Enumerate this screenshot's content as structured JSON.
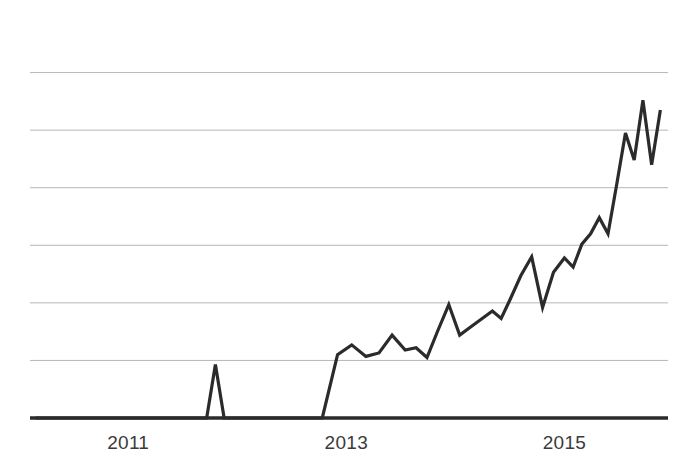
{
  "chart_data": {
    "type": "line",
    "title": "",
    "xlabel": "",
    "ylabel": "",
    "grid": true,
    "legend": false,
    "xlim": [
      2010.1,
      2015.95
    ],
    "ylim": [
      0,
      7
    ],
    "xticks": [
      2011,
      2013,
      2015
    ],
    "xtick_labels": [
      "2011",
      "2013",
      "2015"
    ],
    "yticks": [
      1,
      2,
      3,
      4,
      5,
      6
    ],
    "ytick_labels": [
      "",
      "",
      "",
      "",
      "",
      ""
    ],
    "gridline_count": 6,
    "series": [
      {
        "name": "value",
        "color": "#2b2b2b",
        "line_width": 3.2,
        "x": [
          2010.15,
          2010.35,
          2010.55,
          2010.75,
          2010.95,
          2011.15,
          2011.35,
          2011.55,
          2011.72,
          2011.8,
          2011.88,
          2012.05,
          2012.25,
          2012.45,
          2012.65,
          2012.78,
          2012.92,
          2013.05,
          2013.18,
          2013.3,
          2013.42,
          2013.54,
          2013.64,
          2013.74,
          2013.84,
          2013.94,
          2014.04,
          2014.14,
          2014.24,
          2014.34,
          2014.42,
          2014.5,
          2014.6,
          2014.7,
          2014.8,
          2014.9,
          2015.0,
          2015.08,
          2015.16,
          2015.24,
          2015.32,
          2015.4,
          2015.48,
          2015.56,
          2015.64,
          2015.72,
          2015.8,
          2015.88
        ],
        "y": [
          0.0,
          0.0,
          0.0,
          0.0,
          0.0,
          0.0,
          0.0,
          0.0,
          0.0,
          0.93,
          0.0,
          0.0,
          0.0,
          0.0,
          0.0,
          0.0,
          1.1,
          1.27,
          1.07,
          1.13,
          1.44,
          1.18,
          1.22,
          1.05,
          1.52,
          1.97,
          1.44,
          1.58,
          1.72,
          1.86,
          1.73,
          2.05,
          2.47,
          2.8,
          1.92,
          2.53,
          2.78,
          2.62,
          3.02,
          3.2,
          3.48,
          3.2,
          4.06,
          4.95,
          4.48,
          5.52,
          4.4,
          5.35
        ]
      }
    ],
    "annotations": [],
    "axis": {
      "baseline_color": "#2b2b2b",
      "baseline_width": 3.4,
      "gridline_color": "#b6b6b6"
    }
  },
  "axes": {
    "x_tick_0": "2011",
    "x_tick_1": "2013",
    "x_tick_2": "2015"
  },
  "colors": {
    "background": "#ffffff",
    "line": "#2b2b2b",
    "grid": "#b6b6b6",
    "axis": "#2b2b2b",
    "label_text": "#3b3b3b"
  }
}
